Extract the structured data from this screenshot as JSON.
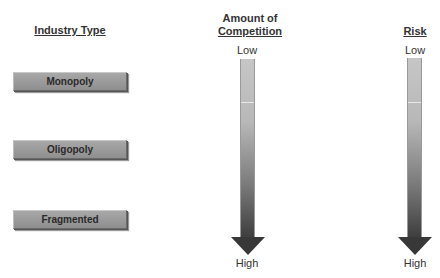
{
  "headers": {
    "industry_type": "Industry Type",
    "competition_line1": "Amount of",
    "competition_line2": "Competition",
    "risk": "Risk"
  },
  "industry_types": [
    {
      "label": "Monopoly"
    },
    {
      "label": "Oligopoly"
    },
    {
      "label": "Fragmented"
    }
  ],
  "competition_scale": {
    "top_label": "Low",
    "bottom_label": "High"
  },
  "risk_scale": {
    "top_label": "Low",
    "bottom_label": "High"
  },
  "colors": {
    "box_fill": "#9c9c9c",
    "arrow_top": "#c6c6c6",
    "arrow_bottom": "#383838"
  }
}
